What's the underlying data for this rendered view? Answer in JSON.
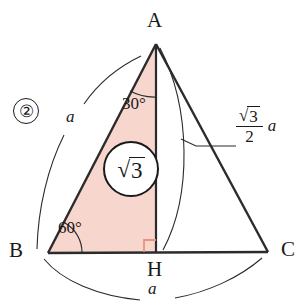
{
  "figure": {
    "item_number": "②",
    "colors": {
      "triangle_fill": "#f7d6cd",
      "stroke": "#2b2b2b",
      "right_angle_marker": "#e8937f",
      "background": "#ffffff"
    },
    "vertices": [
      {
        "name": "A",
        "label": "A",
        "x": 156,
        "y": 44
      },
      {
        "name": "B",
        "label": "B",
        "x": 48,
        "y": 253
      },
      {
        "name": "C",
        "label": "C",
        "x": 268,
        "y": 252
      },
      {
        "name": "H",
        "label": "H",
        "x": 156,
        "y": 252
      }
    ],
    "angles": [
      {
        "at": "A",
        "value": "30°",
        "x": 122,
        "y": 95
      },
      {
        "at": "B",
        "value": "60°",
        "x": 58,
        "y": 222
      }
    ],
    "right_angle": {
      "at": "H",
      "size": 12
    },
    "area_badge": {
      "radical": "√",
      "radicand": "3",
      "cx": 131,
      "cy": 169,
      "r": 28
    },
    "side_labels": [
      {
        "name": "side-ab",
        "text": "a",
        "x": 67,
        "y": 110
      },
      {
        "name": "side-bc",
        "text": "a",
        "x": 151,
        "y": 283
      }
    ],
    "altitude_label": {
      "name": "altitude-ah",
      "numerator_radical": "√",
      "numerator_radicand": "3",
      "denominator": "2",
      "coefficient": "a",
      "x": 238,
      "y": 122
    }
  }
}
